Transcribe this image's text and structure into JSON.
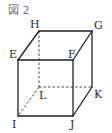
{
  "figure": {
    "title": "図 2",
    "shape": "cube",
    "vertices": [
      "E",
      "F",
      "G",
      "H",
      "I",
      "J",
      "K",
      "L"
    ],
    "visible_edges": [
      [
        "E",
        "F"
      ],
      [
        "F",
        "G"
      ],
      [
        "G",
        "H"
      ],
      [
        "H",
        "E"
      ],
      [
        "E",
        "I"
      ],
      [
        "I",
        "J"
      ],
      [
        "J",
        "F"
      ],
      [
        "J",
        "K"
      ],
      [
        "K",
        "G"
      ]
    ],
    "hidden_edges": [
      [
        "H",
        "L"
      ],
      [
        "L",
        "K"
      ],
      [
        "L",
        "I"
      ]
    ]
  },
  "labels": {
    "H": "H",
    "G": "G",
    "E": "E",
    "F": "F",
    "L": "L",
    "K": "K",
    "I": "I",
    "J": "J"
  },
  "colors": {
    "line": "#222222",
    "text": "#2a2a2a"
  }
}
